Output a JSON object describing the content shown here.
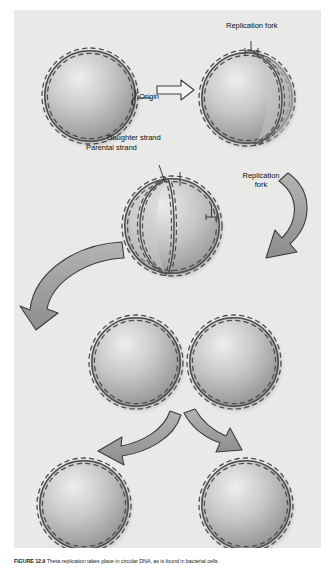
{
  "figure": {
    "panel_background": "#e9e9e7",
    "page_background": "#ffffff",
    "dna_stroke_color": "#4a4a4a",
    "circle_fill_light": "#e4e4e2",
    "circle_fill_dark": "#8e8e8c",
    "arrow_fill": "#9d9d9b",
    "arrow_stroke": "#3c3c3c",
    "label_color": "#111111"
  },
  "labels": {
    "replication_fork_top": "Replication fork",
    "origin": "Origin",
    "daughter_strand": "Daughter strand",
    "parental_strand": "Parental strand",
    "replication_fork_mid_line1": "Replication",
    "replication_fork_mid_line2": "fork"
  },
  "caption": {
    "figure_number": "FIGURE 12.9",
    "text": "Theta replication takes place in circular DNA, as is found in bacterial cells."
  },
  "stages": [
    {
      "id": "stage-1",
      "name": "intact-circular-chromosome",
      "description": "Circular double-stranded chromosome with single origin"
    },
    {
      "id": "stage-2",
      "name": "replication-bubble-initiated",
      "description": "Replication begins at origin forming a bubble with two replication forks"
    },
    {
      "id": "stage-3",
      "name": "theta-intermediate",
      "description": "Theta structure with daughter and parental strands"
    },
    {
      "id": "stage-4",
      "name": "near-complete-replication-left",
      "description": "Replication nearly complete"
    },
    {
      "id": "stage-5",
      "name": "near-complete-replication-right",
      "description": "Replication nearly complete"
    },
    {
      "id": "stage-6",
      "name": "daughter-chromosome-left",
      "description": "Separated daughter circular chromosome"
    },
    {
      "id": "stage-7",
      "name": "daughter-chromosome-right",
      "description": "Separated daughter circular chromosome"
    }
  ],
  "arrows": [
    {
      "id": "arrow-1",
      "name": "straight-right-arrow",
      "direction": "right"
    },
    {
      "id": "arrow-2",
      "name": "curved-down-left-arrow",
      "direction": "down-left"
    },
    {
      "id": "arrow-3",
      "name": "large-curved-down-right-arrow",
      "direction": "down-right"
    },
    {
      "id": "arrow-4",
      "name": "branch-arrow-left",
      "direction": "down-left"
    },
    {
      "id": "arrow-5",
      "name": "branch-arrow-right",
      "direction": "down-right"
    }
  ]
}
